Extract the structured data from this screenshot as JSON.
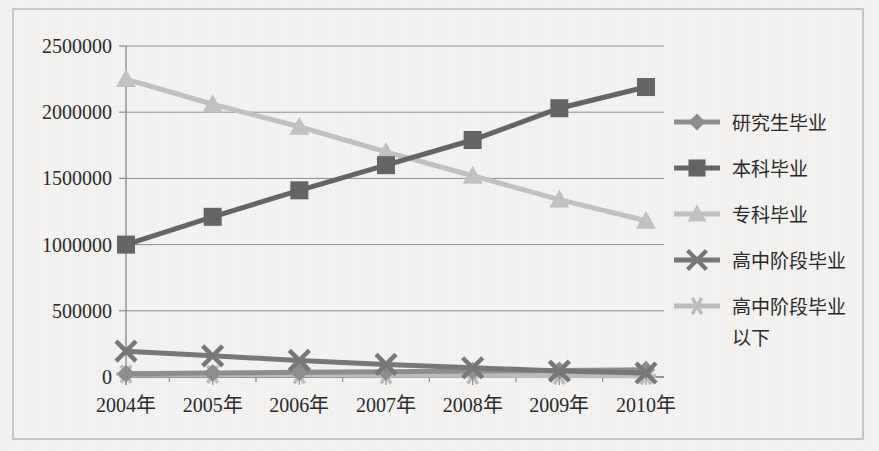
{
  "chart_data": {
    "type": "line",
    "title": "",
    "xlabel": "",
    "ylabel": "",
    "categories": [
      "2004年",
      "2005年",
      "2006年",
      "2007年",
      "2008年",
      "2009年",
      "2010年"
    ],
    "ylim": [
      0,
      2500000
    ],
    "ytick_labels": [
      "0",
      "500000",
      "1000000",
      "1500000",
      "2000000",
      "2500000"
    ],
    "ytick_values": [
      0,
      500000,
      1000000,
      1500000,
      2000000,
      2500000
    ],
    "grid": true,
    "legend_position": "right",
    "series": [
      {
        "name": "研究生毕业",
        "marker": "diamond",
        "color": "#8e8e8e",
        "values": [
          25000,
          30000,
          35000,
          40000,
          45000,
          50000,
          55000
        ]
      },
      {
        "name": "本科毕业",
        "marker": "square",
        "color": "#656565",
        "values": [
          1000000,
          1210000,
          1410000,
          1600000,
          1790000,
          2030000,
          2190000
        ]
      },
      {
        "name": "专科毕业",
        "marker": "triangle",
        "color": "#c2c2c2",
        "values": [
          2250000,
          2060000,
          1890000,
          1700000,
          1520000,
          1340000,
          1180000
        ]
      },
      {
        "name": "高中阶段毕业",
        "marker": "x",
        "color": "#787878",
        "values": [
          195000,
          160000,
          125000,
          95000,
          70000,
          45000,
          30000
        ]
      },
      {
        "name": "高中阶段毕业以下",
        "marker": "star",
        "color": "#bdbdbd",
        "values": [
          22000,
          20000,
          18000,
          16000,
          14000,
          12000,
          10000
        ]
      }
    ]
  },
  "legend": {
    "entries": [
      {
        "label": "研究生毕业"
      },
      {
        "label": "本科毕业"
      },
      {
        "label": "专科毕业"
      },
      {
        "label": "高中阶段毕业"
      },
      {
        "label": "高中阶段毕业"
      },
      {
        "label": "以下"
      }
    ]
  },
  "colors": {
    "background": "#f4f3f1",
    "frame_border": "#c9c7c4",
    "gridline": "#8d8d8d",
    "text": "#2a2a2a"
  }
}
